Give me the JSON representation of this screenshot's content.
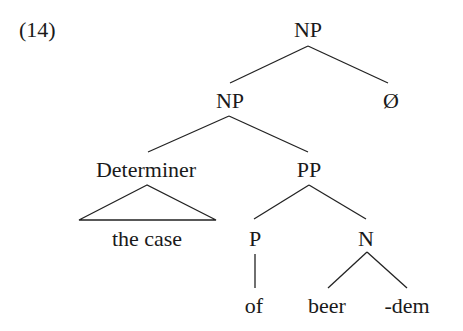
{
  "example_number": "(14)",
  "tree": {
    "root": {
      "label": "NP",
      "x": 308,
      "y": 19
    },
    "np_inner": {
      "label": "NP",
      "x": 230,
      "y": 90
    },
    "null": {
      "label": "Ø",
      "x": 391,
      "y": 90
    },
    "determiner": {
      "label": "Determiner",
      "x": 146,
      "y": 159
    },
    "pp": {
      "label": "PP",
      "x": 309,
      "y": 159
    },
    "determiner_leaf": {
      "label": "the case",
      "x": 147,
      "y": 228
    },
    "p": {
      "label": "P",
      "x": 255,
      "y": 228
    },
    "n": {
      "label": "N",
      "x": 366,
      "y": 228
    },
    "of": {
      "label": "of",
      "x": 254,
      "y": 295
    },
    "beer": {
      "label": "beer",
      "x": 327,
      "y": 295
    },
    "dem": {
      "label": "-dem",
      "x": 407,
      "y": 295
    }
  }
}
